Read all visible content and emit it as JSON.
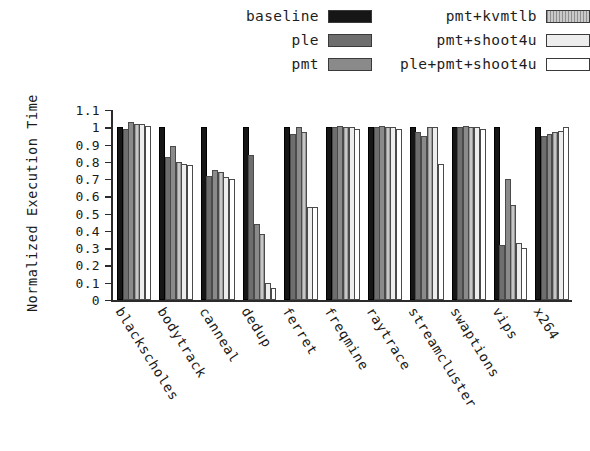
{
  "chart_data": {
    "type": "bar",
    "title": "",
    "xlabel": "",
    "ylabel": "Normalized Execution Time",
    "ylim": [
      0,
      1.1
    ],
    "ytick_labels": [
      "0",
      "0.1",
      "0.2",
      "0.3",
      "0.4",
      "0.5",
      "0.6",
      "0.7",
      "0.8",
      "0.9",
      "1",
      "1.1"
    ],
    "ytick_values": [
      0,
      0.1,
      0.2,
      0.3,
      0.4,
      0.5,
      0.6,
      0.7,
      0.8,
      0.9,
      1.0,
      1.1
    ],
    "grid": false,
    "legend_position": "top",
    "categories": [
      "blackscholes",
      "bodytrack",
      "canneal",
      "dedup",
      "ferret",
      "freqmine",
      "raytrace",
      "streamcluster",
      "swaptions",
      "vips",
      "x264"
    ],
    "series": [
      {
        "name": "baseline",
        "color": "#161616",
        "values": [
          1.0,
          1.0,
          1.0,
          1.0,
          1.0,
          1.0,
          1.0,
          1.0,
          1.0,
          1.0,
          1.0
        ]
      },
      {
        "name": "ple",
        "color": "#6e6e6e",
        "values": [
          0.99,
          0.83,
          0.72,
          0.84,
          0.96,
          1.0,
          1.0,
          0.97,
          1.0,
          0.32,
          0.95
        ]
      },
      {
        "name": "pmt",
        "color": "#8a8a8a",
        "values": [
          1.03,
          0.89,
          0.75,
          0.44,
          1.0,
          1.01,
          1.01,
          0.95,
          1.01,
          0.7,
          0.96
        ]
      },
      {
        "name": "pmt+kvmtlb",
        "color": "#a8a8a8",
        "values": [
          1.02,
          0.8,
          0.74,
          0.38,
          0.97,
          1.0,
          1.0,
          1.0,
          1.0,
          0.55,
          0.97
        ]
      },
      {
        "name": "pmt+shoot4u",
        "color": "#ededed",
        "values": [
          1.02,
          0.79,
          0.71,
          0.1,
          0.54,
          1.0,
          1.0,
          1.0,
          1.0,
          0.33,
          0.98
        ]
      },
      {
        "name": "ple+pmt+shoot4u",
        "color": "#ffffff",
        "values": [
          1.01,
          0.78,
          0.7,
          0.07,
          0.54,
          0.99,
          0.99,
          0.79,
          0.99,
          0.3,
          1.0
        ]
      }
    ]
  },
  "legend": {
    "left_column": [
      "baseline",
      "ple",
      "pmt"
    ],
    "right_column": [
      "pmt+kvmtlb",
      "pmt+shoot4u",
      "ple+pmt+shoot4u"
    ]
  }
}
